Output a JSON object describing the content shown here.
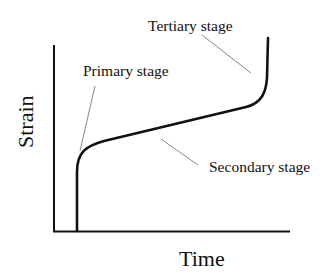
{
  "diagram": {
    "type": "creep-curve",
    "axes": {
      "x_label": "Time",
      "y_label": "Strain"
    },
    "annotations": [
      {
        "id": "primary",
        "label": "Primary stage"
      },
      {
        "id": "secondary",
        "label": "Secondary stage"
      },
      {
        "id": "tertiary",
        "label": "Tertiary stage"
      }
    ],
    "colors": {
      "curve": "#111111",
      "axis": "#111111",
      "pointer": "#888888",
      "text": "#111111"
    }
  }
}
